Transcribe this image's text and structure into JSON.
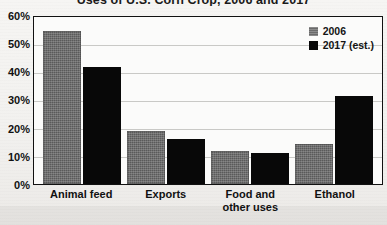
{
  "chart_data": {
    "type": "bar",
    "title": "Uses of U.S. Corn Crop, 2006 and 2017",
    "xlabel": "",
    "ylabel": "",
    "ylim": [
      0,
      60
    ],
    "yticks": [
      "0%",
      "10%",
      "20%",
      "30%",
      "40%",
      "50%",
      "60%"
    ],
    "ytick_values": [
      0,
      10,
      20,
      30,
      40,
      50,
      60
    ],
    "grid": true,
    "legend_position": "top-right",
    "categories": [
      "Animal feed",
      "Exports",
      "Food and other uses",
      "Ethanol"
    ],
    "category_lines": [
      [
        "Animal feed"
      ],
      [
        "Exports"
      ],
      [
        "Food and",
        "other uses"
      ],
      [
        "Ethanol"
      ]
    ],
    "series": [
      {
        "name": "2006",
        "color": "#5a5a5a",
        "values": [
          55,
          19,
          12,
          14.5
        ]
      },
      {
        "name": "2017 (est.)",
        "color": "#080808",
        "values": [
          42,
          16,
          11,
          31.5
        ]
      }
    ]
  },
  "legend": {
    "items": [
      {
        "label": "2006",
        "color": "#5a5a5a"
      },
      {
        "label": "2017 (est.)",
        "color": "#080808"
      }
    ]
  }
}
